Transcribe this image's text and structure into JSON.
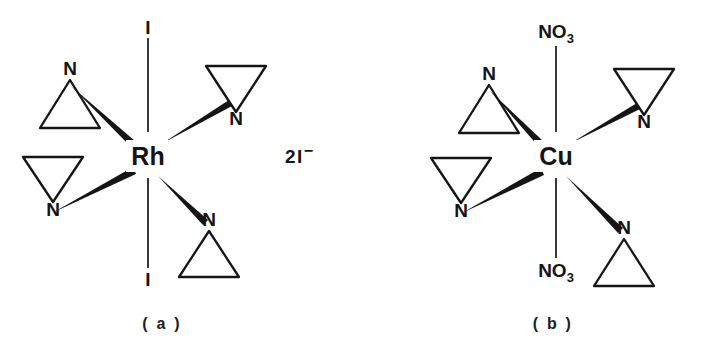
{
  "figure": {
    "caption_a": "( a )",
    "caption_b": "( b )"
  },
  "structures": [
    {
      "id": "structure-a",
      "metal": "Rh",
      "center": {
        "x": 148,
        "y": 156
      },
      "counterion": {
        "text": "2I",
        "charge": "−"
      },
      "axial_top": {
        "label": "I",
        "sub": ""
      },
      "axial_bottom": {
        "label": "I",
        "sub": ""
      },
      "donors": [
        {
          "position": "upper-left",
          "label": "N",
          "ring": "up"
        },
        {
          "position": "upper-right",
          "label": "N",
          "ring": "down"
        },
        {
          "position": "lower-left",
          "label": "N",
          "ring": "down"
        },
        {
          "position": "lower-right",
          "label": "N",
          "ring": "up"
        }
      ]
    },
    {
      "id": "structure-b",
      "metal": "Cu",
      "center": {
        "x": 556,
        "y": 156
      },
      "axial_top": {
        "label": "NO",
        "sub": "3"
      },
      "axial_bottom": {
        "label": "NO",
        "sub": "3"
      },
      "donors": [
        {
          "position": "upper-left",
          "label": "N",
          "ring": "up"
        },
        {
          "position": "upper-right",
          "label": "N",
          "ring": "down"
        },
        {
          "position": "lower-left",
          "label": "N",
          "ring": "down"
        },
        {
          "position": "lower-right",
          "label": "N",
          "ring": "up"
        }
      ]
    }
  ]
}
